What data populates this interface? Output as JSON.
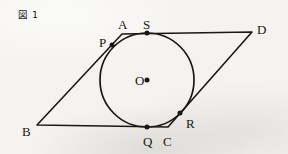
{
  "figure": {
    "caption": "図 1",
    "background_color": "#f4f3f0",
    "ink_color": "#1a1815"
  },
  "chart_data": {
    "type": "diagram",
    "title": "図 1",
    "xlim": [
      0,
      288
    ],
    "ylim": [
      0,
      154
    ],
    "grid": false,
    "legend": "none",
    "shapes": [
      {
        "name": "parallelogram-abcd",
        "kind": "polygon",
        "closed": true,
        "vertices": [
          {
            "label": "A",
            "x": 122,
            "y": 34
          },
          {
            "label": "D",
            "x": 252,
            "y": 32
          },
          {
            "label": "C",
            "x": 168,
            "y": 127
          },
          {
            "label": "B",
            "x": 37,
            "y": 125
          }
        ]
      },
      {
        "name": "inscribed-circle",
        "kind": "circle",
        "center": {
          "label": "O",
          "x": 147,
          "y": 80
        },
        "radius": 47
      }
    ],
    "points": [
      {
        "label": "A",
        "x": 122,
        "y": 34,
        "dot": false,
        "role": "vertex",
        "label_dx": -4,
        "label_dy": -16
      },
      {
        "label": "B",
        "x": 37,
        "y": 125,
        "dot": false,
        "role": "vertex",
        "label_dx": -15,
        "label_dy": 0
      },
      {
        "label": "C",
        "x": 168,
        "y": 127,
        "dot": false,
        "role": "vertex",
        "label_dx": 0,
        "label_dy": 7
      },
      {
        "label": "D",
        "x": 252,
        "y": 32,
        "dot": false,
        "role": "vertex",
        "label_dx": 5,
        "label_dy": -9
      },
      {
        "label": "P",
        "x": 112,
        "y": 45,
        "dot": true,
        "role": "tangent-point",
        "label_dx": -13,
        "label_dy": -9
      },
      {
        "label": "Q",
        "x": 147,
        "y": 127,
        "dot": true,
        "role": "tangent-point",
        "label_dx": -4,
        "label_dy": 8
      },
      {
        "label": "R",
        "x": 180,
        "y": 113,
        "dot": true,
        "role": "tangent-point",
        "label_dx": 6,
        "label_dy": 4
      },
      {
        "label": "S",
        "x": 147,
        "y": 33,
        "dot": true,
        "role": "tangent-point",
        "label_dx": -4,
        "label_dy": -15
      },
      {
        "label": "O",
        "x": 147,
        "y": 80,
        "dot": true,
        "role": "center",
        "label_dx": -12,
        "label_dy": -6
      }
    ],
    "labels": [
      {
        "text": "A",
        "x": 118,
        "y": 18
      },
      {
        "text": "S",
        "x": 143,
        "y": 18
      },
      {
        "text": "D",
        "x": 257,
        "y": 23
      },
      {
        "text": "P",
        "x": 99,
        "y": 36
      },
      {
        "text": "O",
        "x": 135,
        "y": 74
      },
      {
        "text": "R",
        "x": 186,
        "y": 117
      },
      {
        "text": "B",
        "x": 22,
        "y": 125
      },
      {
        "text": "Q",
        "x": 143,
        "y": 135
      },
      {
        "text": "C",
        "x": 163,
        "y": 135
      }
    ]
  }
}
